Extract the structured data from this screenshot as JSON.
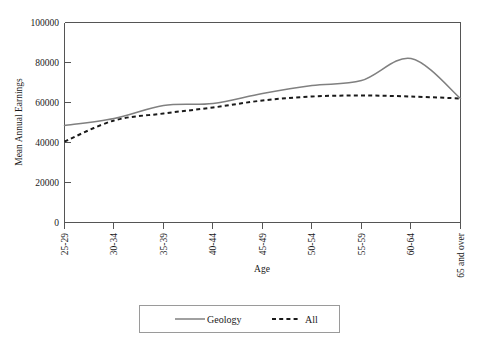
{
  "chart_data": {
    "type": "line",
    "title": "",
    "xlabel": "Age",
    "ylabel": "Mean Annual Earnings",
    "categories": [
      "25-29",
      "30-34",
      "35-39",
      "40-44",
      "45-49",
      "50-54",
      "55-59",
      "60-64",
      "65 and over"
    ],
    "ylim": [
      0,
      100000
    ],
    "yticks": [
      0,
      20000,
      40000,
      60000,
      80000,
      100000
    ],
    "ytick_labels": [
      "0",
      "20000",
      "40000",
      "60000",
      "80000",
      "100000"
    ],
    "grid": false,
    "legend_position": "bottom",
    "series": [
      {
        "name": "Geology",
        "color": "#808080",
        "style": "solid",
        "values": [
          48500,
          52000,
          58500,
          59500,
          64500,
          68500,
          71000,
          82000,
          62000
        ]
      },
      {
        "name": "All",
        "color": "#1a1a1a",
        "style": "dashed",
        "values": [
          40500,
          51000,
          54500,
          57500,
          61000,
          63000,
          63500,
          63000,
          62000
        ]
      }
    ]
  },
  "legend": {
    "items": [
      {
        "label": "Geology"
      },
      {
        "label": "All"
      }
    ]
  }
}
